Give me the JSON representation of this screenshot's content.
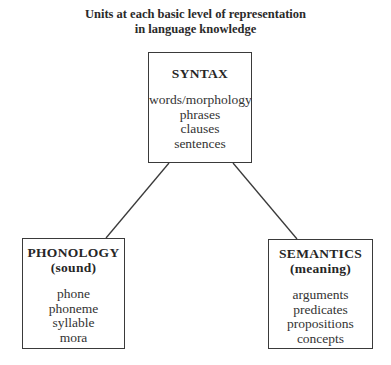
{
  "title": {
    "line1": "Units at each basic level of representation",
    "line2": "in language knowledge"
  },
  "nodes": {
    "syntax": {
      "heading": "SYNTAX",
      "items": [
        "words/morphology",
        "phrases",
        "clauses",
        "sentences"
      ]
    },
    "phonology": {
      "heading": "PHONOLOGY",
      "subheading": "(sound)",
      "items": [
        "phone",
        "phoneme",
        "syllable",
        "mora"
      ]
    },
    "semantics": {
      "heading": "SEMANTICS",
      "subheading": "(meaning)",
      "items": [
        "arguments",
        "predicates",
        "propositions",
        "concepts"
      ]
    }
  },
  "edges": [
    {
      "from": "syntax",
      "to": "phonology"
    },
    {
      "from": "syntax",
      "to": "semantics"
    }
  ],
  "colors": {
    "line": "#3a3a3a",
    "text": "#262626",
    "background": "#ffffff"
  }
}
